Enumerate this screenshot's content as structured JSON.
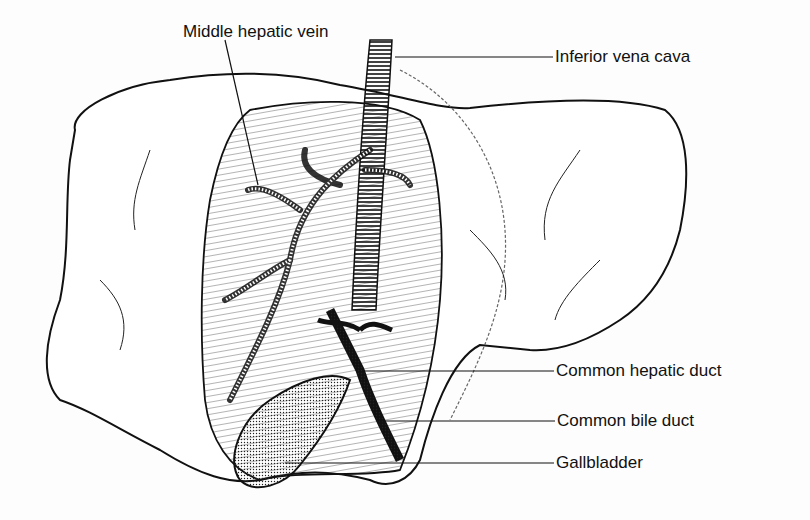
{
  "diagram": {
    "labels": [
      {
        "id": "middle-hepatic-vein",
        "text": "Middle hepatic vein",
        "x": 183,
        "y": 22
      },
      {
        "id": "inferior-vena-cava",
        "text": "Inferior vena cava",
        "x": 555,
        "y": 47
      },
      {
        "id": "common-hepatic-duct",
        "text": "Common hepatic duct",
        "x": 556,
        "y": 361
      },
      {
        "id": "common-bile-duct",
        "text": "Common bile duct",
        "x": 557,
        "y": 411
      },
      {
        "id": "gallbladder",
        "text": "Gallbladder",
        "x": 556,
        "y": 453
      }
    ]
  }
}
